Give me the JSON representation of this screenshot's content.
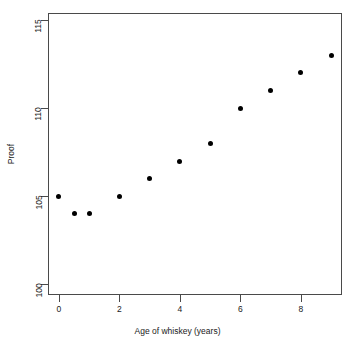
{
  "chart_data": {
    "type": "scatter",
    "title": "",
    "xlabel": "Age of whiskey (years)",
    "ylabel": "Proof",
    "xlim": [
      -0.36,
      9.36
    ],
    "ylim": [
      99.4,
      115.4
    ],
    "xticks": [
      0,
      2,
      4,
      6,
      8
    ],
    "xtick_labels": [
      "0",
      "2",
      "4",
      "6",
      "8"
    ],
    "yticks": [
      100,
      105,
      110,
      115
    ],
    "ytick_labels": [
      "100",
      "105",
      "110",
      "115"
    ],
    "grid": false,
    "legend": null,
    "point_color": "#000000",
    "point_shape": "filled-circle",
    "axis_color": "#4a4a4a",
    "background": "#ffffff",
    "x": [
      0,
      0.5,
      1,
      2,
      3,
      4,
      5,
      6,
      7,
      8,
      9
    ],
    "y": [
      105,
      104,
      104,
      105,
      106,
      107,
      108,
      110,
      111,
      112,
      113
    ],
    "points": [
      {
        "x": 0,
        "y": 105
      },
      {
        "x": 0.5,
        "y": 104
      },
      {
        "x": 1,
        "y": 104
      },
      {
        "x": 2,
        "y": 105
      },
      {
        "x": 3,
        "y": 106
      },
      {
        "x": 4,
        "y": 107
      },
      {
        "x": 5,
        "y": 108
      },
      {
        "x": 6,
        "y": 110
      },
      {
        "x": 7,
        "y": 111
      },
      {
        "x": 8,
        "y": 112
      },
      {
        "x": 9,
        "y": 113
      }
    ]
  }
}
